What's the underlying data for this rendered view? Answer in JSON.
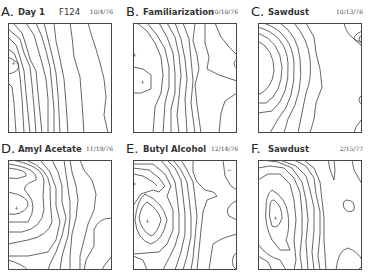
{
  "figure": {
    "panels": [
      {
        "letter": "A.",
        "title": "Day 1",
        "extra": "F124",
        "date": "10/4/76"
      },
      {
        "letter": "B.",
        "title": "Familiarization",
        "extra": "",
        "date": "10/10/76"
      },
      {
        "letter": "C.",
        "title": "Sawdust",
        "extra": "",
        "date": "10/13/76"
      },
      {
        "letter": "D.",
        "title": "Amyl Acetate",
        "extra": "",
        "date": "11/19/76"
      },
      {
        "letter": "E.",
        "title": "Butyl Alcohol",
        "extra": "",
        "date": "12/14/76"
      },
      {
        "letter": "F.",
        "title": "Sawdust",
        "extra": "",
        "date": "2/15/77"
      }
    ],
    "markers": {
      "peak_symbol": "+",
      "trough_symbol": "−"
    }
  }
}
